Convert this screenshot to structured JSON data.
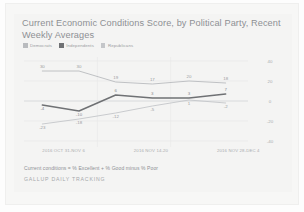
{
  "chart_data": {
    "type": "line",
    "title": "Current Economic Conditions Score, by Political Party, Recent Weekly Averages",
    "xlabel": "",
    "ylabel": "",
    "ylim": [
      -40,
      40
    ],
    "yticks": [
      40,
      20,
      0,
      -20,
      -40
    ],
    "grid": true,
    "legend_position": "top-left",
    "categories": [
      "",
      "",
      "",
      "",
      "",
      ""
    ],
    "xaxis_groups": [
      "2016 OCT 31-NOV 6",
      "2016 NOV 14-20",
      "2016 NOV 28-DEC 4"
    ],
    "series": [
      {
        "name": "Democrats",
        "color": "#b9bbbe",
        "values": [
          30,
          30,
          19,
          17,
          20,
          18
        ]
      },
      {
        "name": "Independents",
        "color": "#6f7174",
        "values": [
          -4,
          -10,
          6,
          3,
          3,
          7
        ]
      },
      {
        "name": "Republicans",
        "color": "#c4c6c9",
        "values": [
          -23,
          -18,
          -12,
          -5,
          1,
          -2
        ]
      }
    ],
    "footnote": "Current conditions = % Excellent + % Good minus % Poor",
    "source": "GALLUP DAILY TRACKING"
  },
  "legend": {
    "items": [
      {
        "label": "Democrats",
        "color": "#b9bbbe"
      },
      {
        "label": "Independents",
        "color": "#6f7174"
      },
      {
        "label": "Republicans",
        "color": "#c4c6c9"
      }
    ]
  }
}
